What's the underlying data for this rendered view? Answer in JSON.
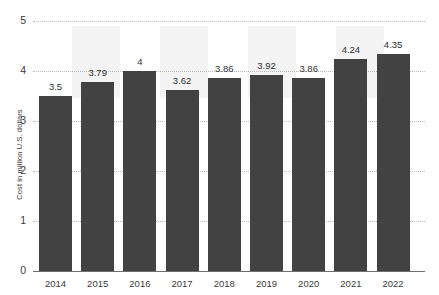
{
  "chart_data": {
    "type": "bar",
    "title": "",
    "subtitle": "",
    "xlabel": "",
    "ylabel": "Cost in million U.S. dollars",
    "categories": [
      "2014",
      "2015",
      "2016",
      "2017",
      "2018",
      "2019",
      "2020",
      "2021",
      "2022"
    ],
    "values": [
      3.5,
      3.79,
      4,
      3.62,
      3.86,
      3.92,
      3.86,
      4.24,
      4.35
    ],
    "value_labels": [
      "3.5",
      "3.79",
      "4",
      "3.62",
      "3.86",
      "3.92",
      "3.86",
      "4.24",
      "4.35"
    ],
    "ylim": [
      0,
      5
    ],
    "y_ticks": [
      0,
      1,
      2,
      3,
      4,
      5
    ],
    "y_tick_labels": [
      "0",
      "1",
      "2",
      "3",
      "4",
      "5"
    ],
    "grid": true,
    "grid_axis": "y",
    "legend": false,
    "legend_position": "none",
    "series": [
      {
        "name": "Average cost of a data breach",
        "color": "#424242",
        "values": [
          3.5,
          3.79,
          4,
          3.62,
          3.86,
          3.92,
          3.86,
          4.24,
          4.35
        ]
      }
    ]
  },
  "colors": {
    "bar": "#424242",
    "grid": "#b9b9b9",
    "axis": "#6e6e6e",
    "text": "#3a3a3a",
    "band": "#f3f3f3",
    "background": "#ffffff"
  }
}
